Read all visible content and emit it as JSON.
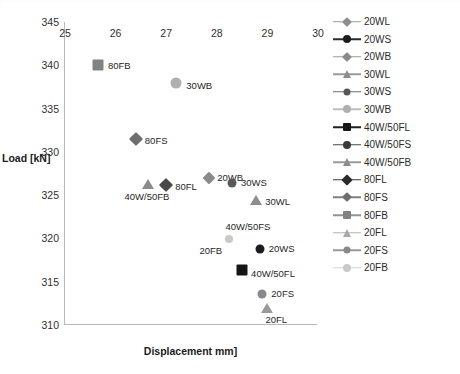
{
  "chart_data": {
    "type": "scatter",
    "title": "",
    "xlabel": "Displacement mm]",
    "ylabel": "Load [kN]",
    "xlim": [
      25,
      30
    ],
    "ylim": [
      310,
      345
    ],
    "xticks": [
      "25",
      "26",
      "27",
      "28",
      "29",
      "30"
    ],
    "yticks": [
      "310",
      "315",
      "320",
      "325",
      "330",
      "335",
      "340",
      "345"
    ],
    "grid": false,
    "legend_position": "right",
    "series": [
      {
        "name": "20WL",
        "marker": "diamond",
        "color": "#8e8e8e",
        "size": 8,
        "x": null,
        "y": null,
        "label": "20WL",
        "label_dx": 16,
        "label_dy": 8
      },
      {
        "name": "20WS",
        "marker": "circle",
        "color": "#1c1c1c",
        "size": 9,
        "x": 28.85,
        "y": 318.8,
        "label": "20WS",
        "label_dx": 9,
        "label_dy": -1
      },
      {
        "name": "20WB",
        "marker": "diamond",
        "color": "#8a8a8a",
        "size": 9,
        "x": 27.85,
        "y": 327.0,
        "label": "20WB",
        "label_dx": 8,
        "label_dy": -1
      },
      {
        "name": "30WL",
        "marker": "triangle",
        "color": "#8d8d8d",
        "size": 10,
        "x": 28.78,
        "y": 324.4,
        "label": "30WL",
        "label_dx": 9,
        "label_dy": 1
      },
      {
        "name": "30WS",
        "marker": "circle",
        "color": "#585858",
        "size": 9,
        "x": 28.3,
        "y": 326.4,
        "label": "30WS",
        "label_dx": 9,
        "label_dy": -1
      },
      {
        "name": "30WB",
        "marker": "circle",
        "color": "#b0b0b0",
        "size": 11,
        "x": 27.2,
        "y": 338.0,
        "label": "30WB",
        "label_dx": 10,
        "label_dy": 2
      },
      {
        "name": "40W/50FL",
        "marker": "square",
        "color": "#151515",
        "size": 11,
        "x": 28.5,
        "y": 316.4,
        "label": "40W/50FL",
        "label_dx": 9,
        "label_dy": 3
      },
      {
        "name": "40W/50FS",
        "marker": "circle",
        "color": "#cfcfcf",
        "size": 7,
        "x": 28.25,
        "y": 319.9,
        "label": "40W/50FS",
        "label_dx": -4,
        "label_dy": -13
      },
      {
        "name": "40W/50FB",
        "marker": "triangle",
        "color": "#8b8b8b",
        "size": 10,
        "x": 26.65,
        "y": 326.3,
        "label": "40W/50FB",
        "label_dx": -24,
        "label_dy": 12
      },
      {
        "name": "80FL",
        "marker": "diamond",
        "color": "#4a4a4a",
        "size": 10,
        "x": 27.0,
        "y": 326.2,
        "label": "80FL",
        "label_dx": 9,
        "label_dy": 1
      },
      {
        "name": "80FS",
        "marker": "diamond",
        "color": "#6e6e6e",
        "size": 10,
        "x": 26.4,
        "y": 331.5,
        "label": "80FS",
        "label_dx": 9,
        "label_dy": 1
      },
      {
        "name": "80FB",
        "marker": "square",
        "color": "#828282",
        "size": 11,
        "x": 25.65,
        "y": 340.0,
        "label": "80FB",
        "label_dx": 10,
        "label_dy": 0
      },
      {
        "name": "20FL",
        "marker": "triangle",
        "color": "#9a9a9a",
        "size": 10,
        "x": 29.0,
        "y": 312.0,
        "label": "20FL",
        "label_dx": -2,
        "label_dy": 11
      },
      {
        "name": "20FS",
        "marker": "circle",
        "color": "#888888",
        "size": 9,
        "x": 28.9,
        "y": 313.6,
        "label": "20FS",
        "label_dx": 9,
        "label_dy": -1
      },
      {
        "name": "20FB",
        "marker": "circle",
        "color": "#c9c9c9",
        "size": 8,
        "x": 28.25,
        "y": 319.9,
        "label": "20FB",
        "label_dx": -30,
        "label_dy": 11
      }
    ]
  },
  "legend": {
    "items": [
      {
        "label": "20WL",
        "marker": "diamond",
        "color": "#8e8e8e",
        "size": 7,
        "line": "#9a9a9a"
      },
      {
        "label": "20WS",
        "marker": "circle",
        "color": "#1c1c1c",
        "size": 8,
        "line": "#2b2b2b"
      },
      {
        "label": "20WB",
        "marker": "diamond",
        "color": "#8a8a8a",
        "size": 7,
        "line": "#9a9a9a"
      },
      {
        "label": "30WL",
        "marker": "triangle",
        "color": "#8d8d8d",
        "size": 8,
        "line": "#9a9a9a"
      },
      {
        "label": "30WS",
        "marker": "circle",
        "color": "#585858",
        "size": 7,
        "line": "#6e6e6e"
      },
      {
        "label": "30WB",
        "marker": "circle",
        "color": "#b0b0b0",
        "size": 8,
        "line": "#bdbdbd"
      },
      {
        "label": "40W/50FL",
        "marker": "square",
        "color": "#151515",
        "size": 8,
        "line": "#202020"
      },
      {
        "label": "40W/50FS",
        "marker": "circle",
        "color": "#3a3a3a",
        "size": 8,
        "line": "#4a4a4a"
      },
      {
        "label": "40W/50FB",
        "marker": "triangle",
        "color": "#8b8b8b",
        "size": 8,
        "line": "#9a9a9a"
      },
      {
        "label": "80FL",
        "marker": "diamond",
        "color": "#2a2a2a",
        "size": 8,
        "line": "#3a3a3a"
      },
      {
        "label": "80FS",
        "marker": "diamond",
        "color": "#6e6e6e",
        "size": 7,
        "line": "#808080"
      },
      {
        "label": "80FB",
        "marker": "square",
        "color": "#828282",
        "size": 8,
        "line": "#949494"
      },
      {
        "label": "20FL",
        "marker": "triangle",
        "color": "#a8a8a8",
        "size": 8,
        "line": "#b4b4b4"
      },
      {
        "label": "20FS",
        "marker": "circle",
        "color": "#888888",
        "size": 7,
        "line": "#989898"
      },
      {
        "label": "20FB",
        "marker": "circle",
        "color": "#c9c9c9",
        "size": 8,
        "line": "#d2d2d2"
      }
    ]
  }
}
